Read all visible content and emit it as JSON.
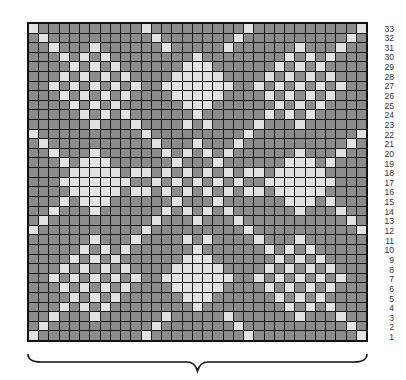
{
  "chart": {
    "title": "",
    "columns": 33,
    "rows": 33,
    "colors": {
      "dark_stitch": "#8c8c8c",
      "light_stitch": "#e2e2e2",
      "grid_line": "#1a1a1a"
    },
    "row_labels": [
      "33",
      "32",
      "31",
      "30",
      "29",
      "28",
      "27",
      "26",
      "25",
      "24",
      "23",
      "22",
      "21",
      "20",
      "19",
      "18",
      "17",
      "16",
      "15",
      "14",
      "13",
      "12",
      "11",
      "10",
      "9",
      "8",
      "7",
      "6",
      "5",
      "4",
      "3",
      "2",
      "1"
    ],
    "light_cells_by_row": {
      "33": [
        1,
        12,
        22,
        33
      ],
      "32": [
        2,
        13,
        21,
        32
      ],
      "31": [
        3,
        7,
        14,
        20,
        27,
        31
      ],
      "30": [
        4,
        6,
        8,
        17,
        26,
        28,
        30
      ],
      "29": [
        5,
        7,
        9,
        16,
        17,
        18,
        25,
        27,
        29
      ],
      "28": [
        4,
        6,
        8,
        10,
        15,
        16,
        17,
        18,
        19,
        24,
        26,
        28,
        30
      ],
      "27": [
        3,
        5,
        7,
        9,
        11,
        14,
        15,
        16,
        17,
        18,
        19,
        20,
        23,
        25,
        27,
        29,
        31
      ],
      "26": [
        4,
        6,
        8,
        10,
        15,
        16,
        17,
        18,
        19,
        24,
        26,
        28,
        30
      ],
      "25": [
        5,
        7,
        9,
        16,
        17,
        18,
        25,
        27,
        29
      ],
      "24": [
        6,
        8,
        10,
        17,
        24,
        26,
        28
      ],
      "23": [
        7,
        11,
        16,
        18,
        23,
        27
      ],
      "22": [
        1,
        12,
        22,
        33
      ],
      "21": [
        2,
        13,
        17,
        21,
        32
      ],
      "20": [
        3,
        7,
        14,
        16,
        18,
        20,
        27,
        31
      ],
      "19": [
        4,
        6,
        7,
        8,
        15,
        19,
        26,
        27,
        28,
        30
      ],
      "18": [
        5,
        6,
        7,
        8,
        9,
        11,
        12,
        14,
        16,
        18,
        20,
        22,
        23,
        25,
        26,
        27,
        28,
        29
      ],
      "17": [
        4,
        5,
        6,
        7,
        8,
        9,
        10,
        13,
        15,
        17,
        19,
        21,
        24,
        25,
        26,
        27,
        28,
        29,
        30
      ],
      "16": [
        5,
        6,
        7,
        8,
        9,
        11,
        12,
        14,
        16,
        18,
        20,
        22,
        23,
        25,
        26,
        27,
        28,
        29
      ],
      "15": [
        4,
        6,
        7,
        8,
        15,
        19,
        26,
        27,
        28,
        30
      ],
      "14": [
        3,
        7,
        14,
        16,
        18,
        20,
        27,
        31
      ],
      "13": [
        2,
        13,
        17,
        21,
        32
      ],
      "12": [
        1,
        12,
        22,
        33
      ],
      "11": [
        7,
        11,
        16,
        18,
        23,
        27
      ],
      "10": [
        6,
        8,
        10,
        17,
        24,
        26,
        28
      ],
      "9": [
        5,
        7,
        9,
        16,
        17,
        18,
        25,
        27,
        29
      ],
      "8": [
        4,
        6,
        8,
        10,
        15,
        16,
        17,
        18,
        19,
        24,
        26,
        28,
        30
      ],
      "7": [
        3,
        5,
        7,
        9,
        11,
        14,
        15,
        16,
        17,
        18,
        19,
        20,
        23,
        25,
        27,
        29,
        31
      ],
      "6": [
        4,
        6,
        8,
        10,
        15,
        16,
        17,
        18,
        19,
        24,
        26,
        28,
        30
      ],
      "5": [
        5,
        7,
        9,
        16,
        17,
        18,
        25,
        27,
        29
      ],
      "4": [
        4,
        6,
        8,
        17,
        26,
        28,
        30
      ],
      "3": [
        3,
        7,
        14,
        20,
        27,
        31
      ],
      "2": [
        2,
        13,
        21,
        32
      ],
      "1": [
        1,
        12,
        22,
        33
      ]
    },
    "repeat_brace": {
      "from_col": 1,
      "to_col": 33
    }
  }
}
